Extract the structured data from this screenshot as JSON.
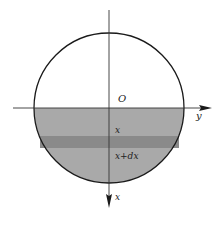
{
  "diagram": {
    "type": "circle-cross-section",
    "labels": {
      "origin": "O",
      "horizontal_axis": "y",
      "vertical_axis": "x",
      "strip_top": "x",
      "strip_bottom": "x+dx"
    },
    "colors": {
      "background": "#ffffff",
      "lower_fill": "#a9a9a9",
      "strip_fill": "#8a8a8a",
      "stroke": "#1a1a1a"
    },
    "geometry": {
      "circle": {
        "cx": 109,
        "cy": 108,
        "r": 75
      },
      "axis_h": {
        "x1": 13,
        "x2": 212,
        "y": 108
      },
      "axis_v": {
        "x": 109,
        "y1": 10,
        "y2": 208
      },
      "strip": {
        "x": 40,
        "y": 136,
        "w": 139,
        "h": 12
      }
    }
  }
}
